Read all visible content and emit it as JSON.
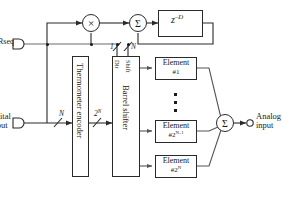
{
  "diagram": {
    "ports": {
      "rseq_label": "Rseq",
      "digital_input_line1": "Digital",
      "digital_input_line2": "input",
      "analog_input_line1": "Analog",
      "analog_input_line2": "input"
    },
    "blocks": {
      "delay": "z",
      "delay_exponent": "–D",
      "encoder": "Thermometer encoder",
      "shifter": "Barrel shifter",
      "shift_label": "Shift",
      "dir_label": "Dir"
    },
    "operators": {
      "multiplier": "×",
      "adder": "Σ",
      "output_summer": "Σ"
    },
    "bus_labels": {
      "digital_width": "N",
      "thermometer_width_base": "2",
      "thermometer_width_exp": "N",
      "dir_width": "1",
      "shift_width": "N"
    },
    "elements": [
      {
        "name": "Element",
        "index_prefix": "#",
        "index_base": "1",
        "index_exp": ""
      },
      {
        "name": "Element",
        "index_prefix": "#",
        "index_base": "2",
        "index_exp": "N–1"
      },
      {
        "name": "Element",
        "index_prefix": "#",
        "index_base": "2",
        "index_exp": "N"
      }
    ],
    "ellipsis": "⋮",
    "colors": {
      "stroke": "#2a2a2a",
      "text": "#1a1a1a",
      "background": "#ffffff"
    }
  }
}
